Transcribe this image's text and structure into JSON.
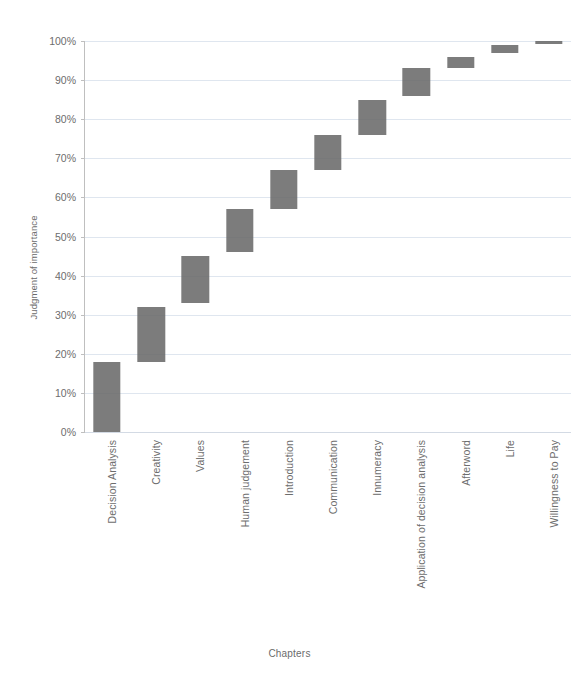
{
  "chart_data": {
    "type": "bar",
    "subtype": "waterfall-cumulative",
    "title": "",
    "xlabel": "Chapters",
    "ylabel": "Judgment of importance",
    "ylim": [
      0,
      100
    ],
    "y_unit": "%",
    "grid": true,
    "legend": false,
    "legend_position": "none",
    "bar_color": "#6a6a6a",
    "gridline_color": "#dfe6ef",
    "axis_color": "#bfbfbf",
    "text_color": "#6d6d6d",
    "x_tick_rotation": -90,
    "categories": [
      "Decision Analysis",
      "Creativity",
      "Values",
      "Human judgement",
      "Introduction",
      "Communication",
      "Innumeracy",
      "Application of decision analysis",
      "Afterword",
      "Life",
      "Willingness to Pay"
    ],
    "y_ticks": [
      "0%",
      "10%",
      "20%",
      "30%",
      "40%",
      "50%",
      "60%",
      "70%",
      "80%",
      "90%",
      "100%"
    ],
    "y_tick_values": [
      0,
      10,
      20,
      30,
      40,
      50,
      60,
      70,
      80,
      90,
      100
    ],
    "values": [
      18,
      14,
      12,
      11,
      10,
      9,
      9,
      7,
      6,
      3,
      1
    ],
    "segments": [
      {
        "category": "Decision Analysis",
        "base": 0,
        "top": 18,
        "value": 18
      },
      {
        "category": "Creativity",
        "base": 18,
        "top": 32,
        "value": 14
      },
      {
        "category": "Values",
        "base": 33,
        "top": 45,
        "value": 12
      },
      {
        "category": "Human judgement",
        "base": 46,
        "top": 57,
        "value": 11
      },
      {
        "category": "Introduction",
        "base": 57,
        "top": 67,
        "value": 10
      },
      {
        "category": "Communication",
        "base": 67,
        "top": 76,
        "value": 9
      },
      {
        "category": "Innumeracy",
        "base": 76,
        "top": 85,
        "value": 9
      },
      {
        "category": "Application of decision analysis",
        "base": 86,
        "top": 93,
        "value": 7
      },
      {
        "category": "Afterword",
        "base": 93,
        "top": 96,
        "value": 3
      },
      {
        "category": "Life",
        "base": 97,
        "top": 99,
        "value": 2
      },
      {
        "category": "Willingness to Pay",
        "base": 99.3,
        "top": 100,
        "value": 0.7
      }
    ]
  }
}
